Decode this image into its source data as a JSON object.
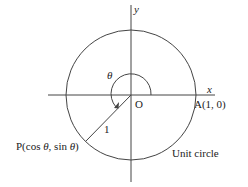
{
  "diagram": {
    "axes": {
      "x_label": "x",
      "y_label": "y"
    },
    "origin_label": "O",
    "point_a_label": "A(1, 0)",
    "point_p_label_prefix": "P(cos ",
    "theta": "θ",
    "point_p_label_mid": ", sin ",
    "point_p_label_suffix": ")",
    "radius_label": "1",
    "circle_label": "Unit circle",
    "angle_label": "θ",
    "colors": {
      "line": "#444444",
      "text": "#222222"
    }
  }
}
